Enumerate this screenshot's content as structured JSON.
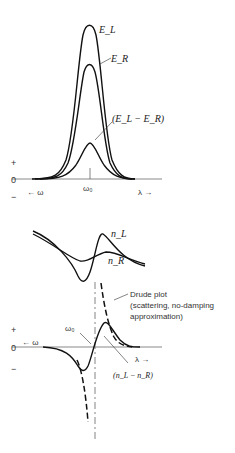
{
  "top_panel": {
    "curves": {
      "E_L": "E_L",
      "E_R": "E_R",
      "diff": "(E_L − E_R)"
    },
    "axis": {
      "plus": "+",
      "zero": "0",
      "minus": "−",
      "omega_arrow": "← ω",
      "lambda_arrow": "λ →",
      "center": "ω₀"
    }
  },
  "bottom_panel": {
    "curves": {
      "n_L": "n_L",
      "n_R": "n_R",
      "diff": "(n_L − n_R)"
    },
    "drude": {
      "line1": "Drude plot",
      "line2": "(scattering, no-damping",
      "line3": "approximation)"
    },
    "axis": {
      "plus": "+",
      "zero": "0",
      "minus": "−",
      "omega_arrow": "← ω",
      "lambda_arrow": "λ →",
      "center": "ω₀"
    }
  }
}
